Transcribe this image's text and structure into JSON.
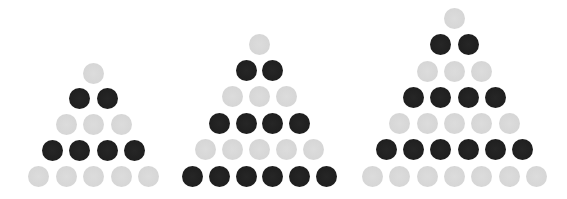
{
  "figure": {
    "colors": {
      "light": "#d8d8d8",
      "dark": "#222222",
      "background": "#ffffff"
    },
    "dot_diameter": 21,
    "triangles": [
      {
        "name": "triangle-5-rows",
        "rows": 5,
        "apex_x": 93.5,
        "top_y": 73,
        "bottom_y": 176,
        "h_spacing": 27.5,
        "row_colors": [
          "light",
          "dark",
          "light",
          "dark",
          "light"
        ],
        "total_dots": 15,
        "light_dots": 9,
        "dark_dots": 6
      },
      {
        "name": "triangle-6-rows",
        "rows": 6,
        "apex_x": 259.5,
        "top_y": 44,
        "bottom_y": 176,
        "h_spacing": 26.8,
        "row_colors": [
          "light",
          "dark",
          "light",
          "dark",
          "light",
          "dark"
        ],
        "total_dots": 21,
        "light_dots": 9,
        "dark_dots": 12
      },
      {
        "name": "triangle-7-rows",
        "rows": 7,
        "apex_x": 454.5,
        "top_y": 18.5,
        "bottom_y": 176,
        "h_spacing": 27.3,
        "row_colors": [
          "light",
          "dark",
          "light",
          "dark",
          "light",
          "dark",
          "light"
        ],
        "total_dots": 28,
        "light_dots": 16,
        "dark_dots": 12
      }
    ]
  }
}
